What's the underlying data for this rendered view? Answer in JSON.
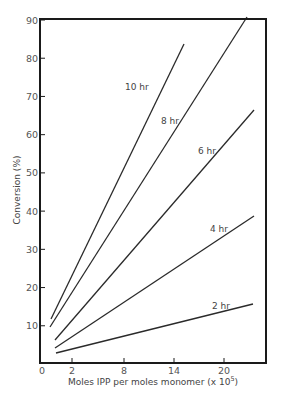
{
  "chart_data": {
    "type": "line",
    "title": "",
    "xlabel": "Moles IPP per moles monomer (x 10^5)",
    "xlabel_display": "Moles IPP per moles monomer (x 10",
    "xlabel_exponent": "5",
    "xlabel_suffix": ")",
    "ylabel": "Conversion (%)",
    "xlim": [
      0,
      24
    ],
    "ylim": [
      0,
      90
    ],
    "x_ticks": [
      {
        "value": 0,
        "label": "0",
        "px": 42
      },
      {
        "value": 2,
        "label": "2",
        "px": 72
      },
      {
        "value": 8,
        "label": "8",
        "px": 124
      },
      {
        "value": 14,
        "label": "14",
        "px": 174
      },
      {
        "value": 20,
        "label": "20",
        "px": 224
      }
    ],
    "y_ticks": [
      {
        "value": 10,
        "label": "10"
      },
      {
        "value": 20,
        "label": "20"
      },
      {
        "value": 30,
        "label": "30"
      },
      {
        "value": 40,
        "label": "40"
      },
      {
        "value": 50,
        "label": "50"
      },
      {
        "value": 60,
        "label": "60"
      },
      {
        "value": 70,
        "label": "70"
      },
      {
        "value": 80,
        "label": "80"
      },
      {
        "value": 90,
        "label": "90"
      }
    ],
    "grid": false,
    "legend": "inline labels on lines",
    "series": [
      {
        "name": "10 hr",
        "x": [
          0.5,
          15.3
        ],
        "y": [
          11.5,
          84
        ],
        "label_pos": [
          125,
          90
        ],
        "px": [
          [
            51,
            319
          ],
          [
            184,
            44
          ]
        ]
      },
      {
        "name": "8 hr",
        "x": [
          0.5,
          22.7
        ],
        "y": [
          9.5,
          90
        ],
        "label_pos": [
          161,
          124
        ],
        "px": [
          [
            50,
            327
          ],
          [
            247,
            17
          ]
        ]
      },
      {
        "name": "6 hr",
        "x": [
          1.0,
          23.6
        ],
        "y": [
          6.2,
          66.5
        ],
        "label_pos": [
          198,
          154
        ],
        "px": [
          [
            55,
            340
          ],
          [
            254,
            110
          ]
        ]
      },
      {
        "name": "4 hr",
        "x": [
          1.0,
          23.6
        ],
        "y": [
          4.2,
          38.2
        ],
        "label_pos": [
          210,
          232
        ],
        "px": [
          [
            55,
            348
          ],
          [
            254,
            216
          ]
        ]
      },
      {
        "name": "2 hr",
        "x": [
          1.0,
          23.6
        ],
        "y": [
          2.9,
          15.8
        ],
        "label_pos": [
          212,
          309
        ],
        "px": [
          [
            56,
            353
          ],
          [
            253,
            304
          ]
        ]
      }
    ]
  }
}
